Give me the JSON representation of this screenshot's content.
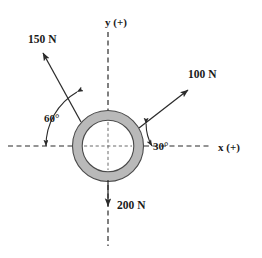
{
  "figure": {
    "kind": "free-body-force-diagram",
    "background_color": "#ffffff",
    "line_color": "#2b2b2b",
    "ring_fill_color": "#b9b9b9",
    "ring_stroke_color": "#4a4a4a",
    "axis_style": "dashed"
  },
  "axes": {
    "x": {
      "label": "x (+)",
      "label_x": 225,
      "label_y": 151,
      "line_x1": 8,
      "line_x2": 210,
      "line_y": 146
    },
    "y": {
      "label": "y (+)",
      "label_x": 116,
      "label_y": 26,
      "line_y1": 32,
      "line_y2": 246,
      "line_x": 108
    }
  },
  "ring": {
    "center_x": 108,
    "center_y": 146,
    "outer_radius": 36,
    "inner_radius": 26
  },
  "forces": [
    {
      "id": "force-100n",
      "label": "100 N",
      "magnitude": 100,
      "unit": "N",
      "angle_from_x_axis_deg": 30,
      "direction": "up-right",
      "label_x": 188,
      "label_y": 78,
      "x1": 139,
      "y1": 128,
      "x2": 188,
      "y2": 90
    },
    {
      "id": "force-150n",
      "label": "150 N",
      "magnitude": 150,
      "unit": "N",
      "angle_from_x_axis_deg": 120,
      "direction": "up-left",
      "label_x": 28,
      "label_y": 43,
      "x1": 81,
      "y1": 122,
      "x2": 43,
      "y2": 53
    },
    {
      "id": "force-200n",
      "label": "200 N",
      "magnitude": 200,
      "unit": "N",
      "angle_from_x_axis_deg": 270,
      "direction": "down",
      "label_x": 117,
      "label_y": 209,
      "x1": 108,
      "y1": 180,
      "x2": 108,
      "y2": 206
    }
  ],
  "angles": [
    {
      "id": "angle-30",
      "label": "30°",
      "value_deg": 30,
      "between": "x-axis and 100 N force",
      "label_x": 166,
      "label_y": 150,
      "arc_radius": 44,
      "arc_start_deg": 0,
      "arc_end_deg": 30
    },
    {
      "id": "angle-60",
      "label": "60°",
      "value_deg": 60,
      "between": "negative x-axis and 150 N force",
      "label_x": 52,
      "label_y": 121,
      "arc_radius": 62,
      "arc_start_deg": 180,
      "arc_end_deg": 120
    }
  ]
}
